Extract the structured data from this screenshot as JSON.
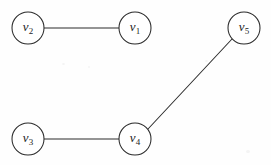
{
  "figure": {
    "kind": "undirected-graph-diagram",
    "width": 271,
    "height": 165,
    "background_color": "#fefefe",
    "stroke_color": "#2b2b2b",
    "label_color": "#1d1d1d",
    "vertex_radius": 16
  },
  "vertices": [
    {
      "id": "v1",
      "label_base": "v",
      "label_sub": "1",
      "text": "v1",
      "cx": 135,
      "cy": 28
    },
    {
      "id": "v2",
      "label_base": "v",
      "label_sub": "2",
      "text": "v2",
      "cx": 28,
      "cy": 28
    },
    {
      "id": "v3",
      "label_base": "v",
      "label_sub": "3",
      "text": "v3",
      "cx": 28,
      "cy": 139
    },
    {
      "id": "v4",
      "label_base": "v",
      "label_sub": "4",
      "text": "v4",
      "cx": 135,
      "cy": 139
    },
    {
      "id": "v5",
      "label_base": "v",
      "label_sub": "5",
      "text": "v5",
      "cx": 244,
      "cy": 28
    }
  ],
  "edges": [
    {
      "id": "e-v2-v1",
      "from": "v2",
      "to": "v1",
      "x1": 44,
      "y1": 28,
      "x2": 119,
      "y2": 28
    },
    {
      "id": "e-v3-v4",
      "from": "v3",
      "to": "v4",
      "x1": 44,
      "y1": 139,
      "x2": 119,
      "y2": 139
    },
    {
      "id": "e-v4-v5",
      "from": "v4",
      "to": "v5",
      "x1": 148,
      "y1": 129,
      "x2": 232,
      "y2": 39
    }
  ],
  "chart_data": {
    "type": "diagram",
    "title": "",
    "nodes": [
      "v1",
      "v2",
      "v3",
      "v4",
      "v5"
    ],
    "edges": [
      [
        "v2",
        "v1"
      ],
      [
        "v3",
        "v4"
      ],
      [
        "v4",
        "v5"
      ]
    ],
    "node_count": 5,
    "edge_count": 3,
    "degrees": {
      "v1": 1,
      "v2": 1,
      "v3": 1,
      "v4": 2,
      "v5": 1
    }
  }
}
